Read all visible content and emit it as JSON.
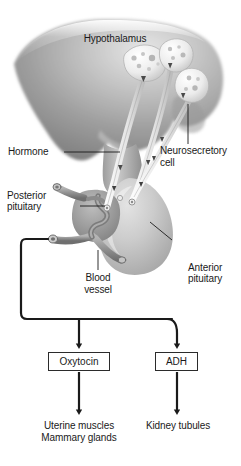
{
  "figure": {
    "width": 241,
    "height": 466,
    "background": "#ffffff"
  },
  "colors": {
    "brain_dark": "#8a8a8a",
    "brain_mid": "#a9a9a9",
    "brain_light": "#d8d8d8",
    "pituitary_light": "#c9c9c9",
    "posterior_gray": "#9b9b9b",
    "vessel_gray": "#8f8f8f",
    "cell_white": "#f2f2f2",
    "granule": "#bdbdbd",
    "line": "#1a1a1a",
    "text": "#1a1a1a",
    "box_border": "#2b2b2b"
  },
  "anatomy_labels": {
    "hypothalamus": "Hypothalamus",
    "hormone": "Hormone",
    "neurosecretory_cell_line1": "Neurosecretory",
    "neurosecretory_cell_line2": "cell",
    "posterior_pituitary_line1": "Posterior",
    "posterior_pituitary_line2": "pituitary",
    "anterior_pituitary_line1": "Anterior",
    "anterior_pituitary_line2": "pituitary",
    "blood_vessel_line1": "Blood",
    "blood_vessel_line2": "vessel"
  },
  "flow": {
    "hormone_boxes": [
      {
        "id": "oxytocin",
        "label": "Oxytocin"
      },
      {
        "id": "adh",
        "label": "ADH"
      }
    ],
    "targets": [
      {
        "id": "oxytocin-targets",
        "line1": "Uterine muscles",
        "line2": "Mammary glands"
      },
      {
        "id": "adh-targets",
        "line1": "Kidney tubules",
        "line2": ""
      }
    ]
  }
}
